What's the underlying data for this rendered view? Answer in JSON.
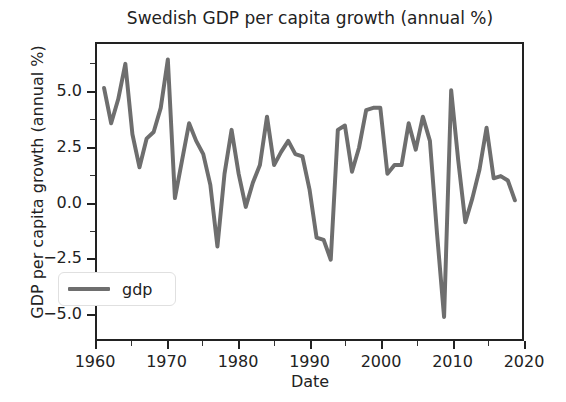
{
  "chart_data": {
    "type": "line",
    "title": "Swedish GDP per capita growth (annual %)",
    "xlabel": "Date",
    "ylabel": "GDP per capita growth (annual %)",
    "xlim": [
      1960,
      2020
    ],
    "ylim": [
      -6.2,
      7.2
    ],
    "xticks": [
      1960,
      1970,
      1980,
      1990,
      2000,
      2010,
      2020
    ],
    "xticklabels": [
      "1960",
      "1970",
      "1980",
      "1990",
      "2000",
      "2010",
      "2020"
    ],
    "xminorticks": [
      1965,
      1975,
      1985,
      1995,
      2005,
      2015
    ],
    "yticks": [
      5.0,
      2.5,
      0.0,
      -2.5,
      -5.0
    ],
    "yticklabels": [
      "5.0",
      "2.5",
      "0.0",
      "−2.5",
      "−5.0"
    ],
    "yminorticks": [
      6.25,
      3.75,
      1.25,
      -1.25,
      -3.75
    ],
    "grid": false,
    "legend_position": "lower left",
    "line_color": "#6e6e6e",
    "line_width": 4,
    "axes_color": "#222222",
    "background": "#ffffff",
    "series": [
      {
        "name": "gdp",
        "x": [
          1961,
          1962,
          1963,
          1964,
          1965,
          1966,
          1967,
          1968,
          1969,
          1970,
          1971,
          1972,
          1973,
          1974,
          1975,
          1976,
          1977,
          1978,
          1979,
          1980,
          1981,
          1982,
          1983,
          1984,
          1985,
          1986,
          1987,
          1988,
          1989,
          1990,
          1991,
          1992,
          1993,
          1994,
          1995,
          1996,
          1997,
          1998,
          1999,
          2000,
          2001,
          2002,
          2003,
          2004,
          2005,
          2006,
          2007,
          2008,
          2009,
          2010,
          2011,
          2012,
          2013,
          2014,
          2015,
          2016,
          2017,
          2018,
          2019
        ],
        "values": [
          5.2,
          3.6,
          4.7,
          6.3,
          3.1,
          1.6,
          2.9,
          3.2,
          4.3,
          6.5,
          0.2,
          1.9,
          3.6,
          2.8,
          2.2,
          0.8,
          -2.0,
          1.3,
          3.3,
          1.3,
          -0.2,
          0.9,
          1.7,
          3.9,
          1.7,
          2.3,
          2.8,
          2.2,
          2.1,
          0.6,
          -1.6,
          -1.7,
          -2.6,
          3.3,
          3.5,
          1.4,
          2.5,
          4.2,
          4.3,
          4.3,
          1.3,
          1.7,
          1.7,
          3.6,
          2.4,
          3.9,
          2.8,
          -1.4,
          -5.2,
          5.1,
          1.9,
          -0.9,
          0.2,
          1.5,
          3.4,
          1.1,
          1.2,
          1.0,
          0.1
        ]
      }
    ]
  },
  "legend": {
    "entries": [
      {
        "label": "gdp",
        "color": "#6e6e6e"
      }
    ]
  }
}
